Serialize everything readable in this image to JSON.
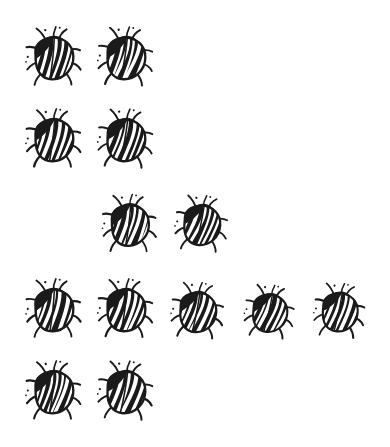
{
  "page": {
    "background_color": "#ffffff",
    "ink_color": "#1a1a1a",
    "width": 390,
    "height": 447,
    "total_count": 13
  },
  "chart_data": {
    "type": "pictograph",
    "subtitle": "",
    "xlabel": "",
    "ylabel": "",
    "icon": "beetle",
    "icon_value": 1,
    "total": 13,
    "categories": [
      "Row 1",
      "Row 2",
      "Row 3",
      "Row 4",
      "Row 5"
    ],
    "values": [
      2,
      2,
      2,
      5,
      2
    ],
    "legend_position": "none",
    "grid": false,
    "annotations": []
  },
  "rows": [
    {
      "name": "row-1",
      "count": 2,
      "top": 22,
      "beetles": [
        {
          "name": "beetle-1",
          "left": 22,
          "top": 22,
          "scale": 1.0,
          "rotate": -2
        },
        {
          "name": "beetle-2",
          "left": 94,
          "top": 22,
          "scale": 1.0,
          "rotate": 1
        }
      ]
    },
    {
      "name": "row-2",
      "count": 2,
      "top": 104,
      "beetles": [
        {
          "name": "beetle-3",
          "left": 22,
          "top": 104,
          "scale": 1.0,
          "rotate": -1
        },
        {
          "name": "beetle-4",
          "left": 94,
          "top": 104,
          "scale": 1.0,
          "rotate": 2
        }
      ]
    },
    {
      "name": "row-3",
      "count": 2,
      "top": 189,
      "beetles": [
        {
          "name": "beetle-5",
          "left": 98,
          "top": 189,
          "scale": 0.98,
          "rotate": -1
        },
        {
          "name": "beetle-6",
          "left": 170,
          "top": 189,
          "scale": 0.95,
          "rotate": 4
        }
      ]
    },
    {
      "name": "row-4",
      "count": 5,
      "top": 274,
      "beetles": [
        {
          "name": "beetle-7",
          "left": 22,
          "top": 274,
          "scale": 1.0,
          "rotate": -2
        },
        {
          "name": "beetle-8",
          "left": 94,
          "top": 274,
          "scale": 1.0,
          "rotate": 0
        },
        {
          "name": "beetle-9",
          "left": 166,
          "top": 276,
          "scale": 0.95,
          "rotate": 3
        },
        {
          "name": "beetle-10",
          "left": 238,
          "top": 277,
          "scale": 0.9,
          "rotate": 5
        },
        {
          "name": "beetle-11",
          "left": 308,
          "top": 276,
          "scale": 0.92,
          "rotate": 4
        }
      ]
    },
    {
      "name": "row-5",
      "count": 2,
      "top": 356,
      "beetles": [
        {
          "name": "beetle-12",
          "left": 22,
          "top": 356,
          "scale": 1.0,
          "rotate": -1
        },
        {
          "name": "beetle-13",
          "left": 94,
          "top": 356,
          "scale": 1.0,
          "rotate": 2
        }
      ]
    }
  ]
}
